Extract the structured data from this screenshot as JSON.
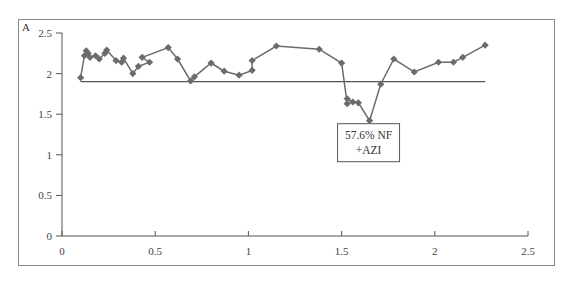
{
  "chart_data": {
    "type": "line",
    "panel_label": "A",
    "title": "",
    "xlabel": "",
    "ylabel": "",
    "xlim": [
      0,
      2.5
    ],
    "ylim": [
      0,
      2.5
    ],
    "x_ticks": [
      "0",
      "0.5",
      "1",
      "1.5",
      "2",
      "2.5"
    ],
    "y_ticks": [
      "0",
      "0.5",
      "1",
      "1.5",
      "2",
      "2.5"
    ],
    "grid": false,
    "legend": null,
    "series": [
      {
        "name": "data",
        "color": "#6b6b6b",
        "marker": "diamond",
        "points": [
          [
            0.1,
            1.95
          ],
          [
            0.12,
            2.22
          ],
          [
            0.13,
            2.28
          ],
          [
            0.14,
            2.25
          ],
          [
            0.15,
            2.2
          ],
          [
            0.18,
            2.22
          ],
          [
            0.2,
            2.18
          ],
          [
            0.23,
            2.25
          ],
          [
            0.24,
            2.29
          ],
          [
            0.29,
            2.16
          ],
          [
            0.32,
            2.14
          ],
          [
            0.33,
            2.19
          ],
          [
            0.38,
            2.0
          ],
          [
            0.41,
            2.09
          ],
          [
            0.47,
            2.14
          ],
          [
            0.43,
            2.2
          ],
          [
            0.57,
            2.32
          ],
          [
            0.62,
            2.18
          ],
          [
            0.69,
            1.91
          ],
          [
            0.71,
            1.96
          ],
          [
            0.8,
            2.13
          ],
          [
            0.87,
            2.03
          ],
          [
            0.95,
            1.98
          ],
          [
            1.02,
            2.04
          ],
          [
            1.02,
            2.16
          ],
          [
            1.15,
            2.34
          ],
          [
            1.38,
            2.3
          ],
          [
            1.5,
            2.13
          ],
          [
            1.53,
            1.63
          ],
          [
            1.53,
            1.69
          ],
          [
            1.56,
            1.65
          ],
          [
            1.59,
            1.64
          ],
          [
            1.65,
            1.42
          ],
          [
            1.71,
            1.87
          ],
          [
            1.78,
            2.18
          ],
          [
            1.89,
            2.02
          ],
          [
            2.02,
            2.14
          ],
          [
            2.1,
            2.14
          ],
          [
            2.15,
            2.2
          ],
          [
            2.27,
            2.35
          ]
        ]
      }
    ],
    "reference_line": {
      "y": 1.9,
      "x_start": 0.1,
      "x_end": 2.27,
      "color": "#555555"
    },
    "annotations": [
      {
        "lines": [
          "57.6%  NF",
          "+AZI"
        ],
        "x": 1.65,
        "y": 1.42,
        "boxed": true
      }
    ]
  }
}
